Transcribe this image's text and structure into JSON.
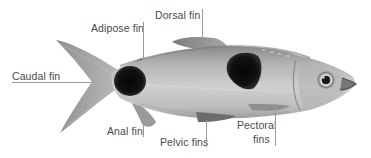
{
  "diagram": {
    "colors": {
      "background": "#ffffff",
      "body_light": "#c8c8c8",
      "body_mid": "#9a9a9a",
      "body_dark": "#6e6e6e",
      "spot": "#0c0c0c",
      "label_text": "#4a4a4a",
      "leader_line": "#9a9a9a"
    },
    "labels": {
      "dorsal_fin": "Dorsal fin",
      "adipose_fin": "Adipose fin",
      "caudal_fin": "Caudal fin",
      "anal_fin": "Anal fin",
      "pelvic_fins": "Pelvic fins",
      "pectoral_fins_line1": "Pectoral",
      "pectoral_fins_line2": "fins"
    }
  }
}
